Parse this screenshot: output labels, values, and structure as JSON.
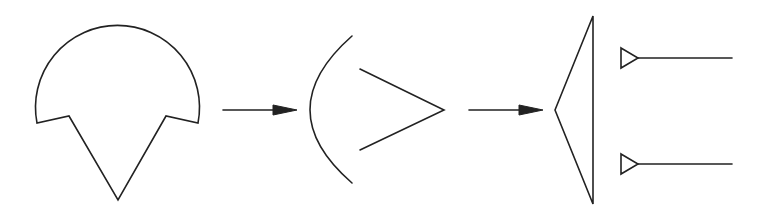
{
  "diagram": {
    "colors": {
      "stroke": "#222222",
      "background": "#ffffff"
    },
    "stages": [
      {
        "id": "stage-1",
        "shape": "notched-dome",
        "label": ""
      },
      {
        "id": "stage-2",
        "shape": "arc-and-chevron",
        "label": ""
      },
      {
        "id": "stage-3",
        "shape": "triangle-with-two-antenna-lines",
        "label": ""
      }
    ],
    "arrows": [
      {
        "from": "stage-1",
        "to": "stage-2"
      },
      {
        "from": "stage-2",
        "to": "stage-3"
      }
    ]
  }
}
